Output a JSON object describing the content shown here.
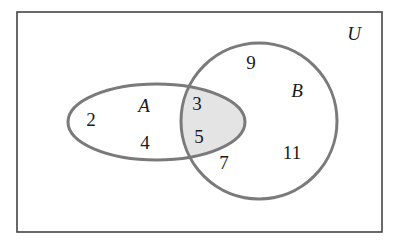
{
  "diagram": {
    "type": "venn",
    "universe": {
      "label": "U",
      "rect": {
        "x": 17,
        "y": 12,
        "width": 365,
        "height": 220
      },
      "stroke": "#444444"
    },
    "sets": [
      {
        "id": "A",
        "label": "A",
        "shape": "ellipse",
        "cx": 156.5,
        "cy": 122,
        "rx": 88.5,
        "ry": 38,
        "stroke": "#7a7a7a",
        "elements_only": [
          "2",
          "4"
        ]
      },
      {
        "id": "B",
        "label": "B",
        "shape": "circle",
        "cx": 259,
        "cy": 121,
        "r": 78,
        "stroke": "#7a7a7a",
        "elements_only": [
          "9",
          "7",
          "11"
        ]
      }
    ],
    "intersection": {
      "label": "A ∩ B",
      "elements": [
        "3",
        "5"
      ],
      "shaded": true,
      "fill": "#e4e4e4"
    },
    "elements": [
      {
        "value": "2",
        "x": 91,
        "y": 126,
        "region": "A only"
      },
      {
        "value": "4",
        "x": 145,
        "y": 149,
        "region": "A only"
      },
      {
        "value": "3",
        "x": 197,
        "y": 110,
        "region": "A ∩ B"
      },
      {
        "value": "5",
        "x": 199,
        "y": 143,
        "region": "A ∩ B"
      },
      {
        "value": "9",
        "x": 251,
        "y": 69,
        "region": "B only"
      },
      {
        "value": "7",
        "x": 224,
        "y": 169,
        "region": "B only"
      },
      {
        "value": "11",
        "x": 292,
        "y": 159,
        "region": "B only"
      }
    ],
    "set_labels": [
      {
        "text": "A",
        "x": 144,
        "y": 112
      },
      {
        "text": "B",
        "x": 297,
        "y": 97
      },
      {
        "text": "U",
        "x": 354,
        "y": 40
      }
    ]
  }
}
